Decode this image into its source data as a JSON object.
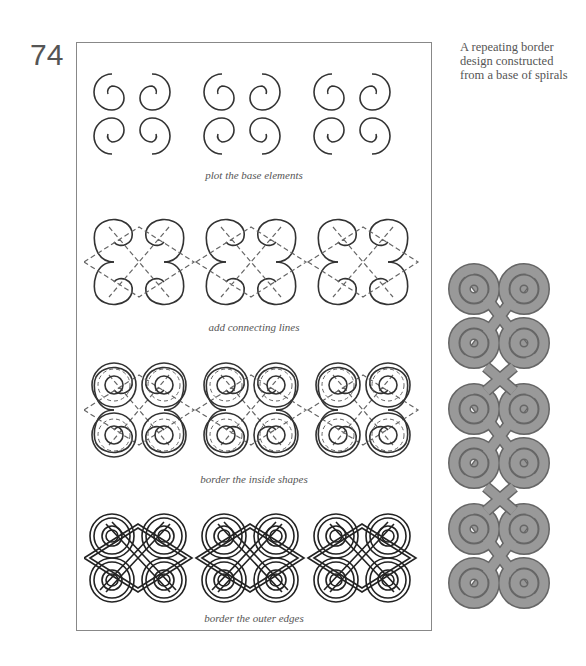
{
  "page": {
    "number": "74",
    "side_note": [
      "A repeating border",
      "design constructed",
      "from a base of spirals"
    ]
  },
  "steps": [
    {
      "caption": "plot the base elements"
    },
    {
      "caption": "add connecting lines"
    },
    {
      "caption": "border the inside shapes"
    },
    {
      "caption": "border the outer edges"
    }
  ],
  "colors": {
    "line": "#333333",
    "frame": "#888888",
    "knot_fill": "#999999",
    "text": "#555555"
  },
  "illustrations": {
    "step_rows": 4,
    "motifs_per_row": 3,
    "vertical_border_units": 3
  }
}
